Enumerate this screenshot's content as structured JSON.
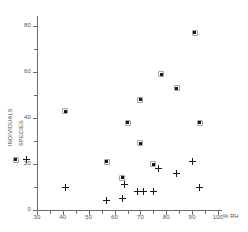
{
  "chart_data": {
    "type": "scatter",
    "title": "",
    "xlabel": "% RH",
    "ylabel": "",
    "xlim": [
      30,
      100
    ],
    "ylim": [
      0,
      80
    ],
    "grid": false,
    "legend_position": "left-inside",
    "x_ticks": [
      30,
      40,
      50,
      60,
      70,
      80,
      90,
      100
    ],
    "x_minor_ticks": [
      35,
      45,
      55,
      65,
      75,
      85,
      95
    ],
    "y_ticks": [
      0,
      20,
      40,
      60,
      80
    ],
    "y_minor_ticks": [
      10,
      30,
      50,
      70
    ],
    "series": [
      {
        "name": "INDIVIDUALS",
        "marker": "filled-square",
        "points": [
          {
            "x": 41,
            "y": 43
          },
          {
            "x": 57,
            "y": 21
          },
          {
            "x": 63,
            "y": 14
          },
          {
            "x": 65,
            "y": 38
          },
          {
            "x": 70,
            "y": 48
          },
          {
            "x": 70,
            "y": 29
          },
          {
            "x": 75,
            "y": 20
          },
          {
            "x": 78,
            "y": 59
          },
          {
            "x": 84,
            "y": 53
          },
          {
            "x": 91,
            "y": 77
          },
          {
            "x": 93,
            "y": 38
          }
        ]
      },
      {
        "name": "SPECIES",
        "marker": "plus",
        "points": [
          {
            "x": 41,
            "y": 10
          },
          {
            "x": 57,
            "y": 4
          },
          {
            "x": 63,
            "y": 5
          },
          {
            "x": 64,
            "y": 11
          },
          {
            "x": 69,
            "y": 8
          },
          {
            "x": 71,
            "y": 8
          },
          {
            "x": 75,
            "y": 8
          },
          {
            "x": 77,
            "y": 18
          },
          {
            "x": 84,
            "y": 16
          },
          {
            "x": 90,
            "y": 21
          },
          {
            "x": 93,
            "y": 10
          }
        ]
      }
    ]
  },
  "axes": {
    "x_title": "% RH",
    "x_tick_labels": [
      "30",
      "40",
      "50",
      "60",
      "70",
      "80",
      "90",
      "100"
    ],
    "y_tick_labels": [
      "0",
      "20",
      "40",
      "60",
      "80"
    ]
  },
  "legend": {
    "individuals_label": "INDIVIDUALS",
    "species_label": "SPECIES"
  },
  "colors": {
    "marker": "#1a1a1a",
    "axis": "#6b6b6b",
    "text": "#555555",
    "background": "#ffffff"
  }
}
